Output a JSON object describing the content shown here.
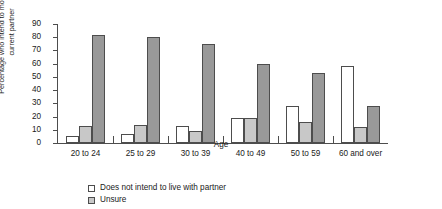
{
  "chart_data": {
    "type": "bar",
    "title": "",
    "subtitle": "",
    "xlabel": "Age",
    "ylabel": "Percentage who intend to move in with current partner",
    "categories": [
      "20 to 24",
      "25 to 29",
      "30 to 39",
      "40 to 49",
      "50 to 59",
      "60 and over"
    ],
    "series": [
      {
        "name": "Does not intend to live with partner",
        "color": "#ffffff",
        "values": [
          5,
          7,
          13,
          19,
          28,
          58
        ]
      },
      {
        "name": "Unsure",
        "color": "#c8c8c8",
        "values": [
          13,
          14,
          9,
          19,
          16,
          12
        ]
      },
      {
        "name": "",
        "color": "#999999",
        "values": [
          82,
          80,
          75,
          60,
          53,
          28
        ]
      }
    ],
    "ylim": [
      0,
      90
    ],
    "yticks": [
      "0",
      "10",
      "20",
      "30",
      "40",
      "50",
      "60",
      "70",
      "80",
      "90"
    ],
    "grid": false,
    "legend_position": "bottom-left",
    "legend": [
      {
        "label": "Does not intend to live with partner",
        "color": "#ffffff"
      },
      {
        "label": "Unsure",
        "color": "#c8c8c8"
      }
    ]
  },
  "axis_color": "#4d4d4d",
  "bar_border_color": "#4d4d4d"
}
